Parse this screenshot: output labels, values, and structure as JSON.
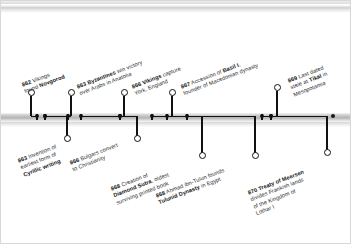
{
  "chart_data": {
    "type": "timeline",
    "title": "",
    "xlabel": "",
    "ylabel": "",
    "axis_range": [
      861.5,
      871.0
    ],
    "grid": false,
    "legend": "none",
    "orientation": "horizontal",
    "events": [
      {
        "year": "862",
        "side": "above",
        "lines": [
          "862 Vikings",
          "found Novgorod"
        ],
        "bold_terms": [
          "862",
          "Novgorod"
        ],
        "full_text": "862 Vikings found Novgorod",
        "tick_x": 37,
        "knob_x": 31,
        "knob_y": 92,
        "label_x": 21,
        "label_y": 82
      },
      {
        "year": "863",
        "side": "below",
        "lines": [
          "863 Invention of",
          "earliest form of",
          "Cyrillic writing"
        ],
        "bold_terms": [
          "863",
          "Cyrillic writing"
        ],
        "full_text": "863 Invention of earliest form of Cyrillic writing",
        "tick_x": 45,
        "knob_x": 67,
        "knob_y": 138,
        "label_x": 17,
        "label_y": 158
      },
      {
        "year": "863",
        "side": "above",
        "lines": [
          "863 Byzantines win victory",
          "over Arabs in Anatolia"
        ],
        "bold_terms": [
          "863",
          "Byzantines"
        ],
        "full_text": "863 Byzantines win victory over Arabs in Anatolia",
        "tick_x": 68,
        "knob_x": 71,
        "knob_y": 92,
        "label_x": 76,
        "label_y": 84
      },
      {
        "year": "866",
        "side": "below",
        "lines": [
          "866 Bulgars convert",
          "to Christianity"
        ],
        "bold_terms": [
          "866"
        ],
        "full_text": "866 Bulgars convert to Christianity",
        "tick_x": 81,
        "knob_x": 137,
        "knob_y": 138,
        "label_x": 69,
        "label_y": 160
      },
      {
        "year": "866",
        "side": "above",
        "lines": [
          "866 Vikings capture",
          "York, England"
        ],
        "bold_terms": [
          "866",
          "Vikings"
        ],
        "full_text": "866 Vikings capture York, England",
        "tick_x": 120,
        "knob_x": 124,
        "knob_y": 92,
        "label_x": 131,
        "label_y": 84
      },
      {
        "year": "868",
        "side": "below",
        "lines": [
          "868 Creation of",
          "Diamond Sutra, oldest",
          "surviving printed book"
        ],
        "bold_terms": [
          "868",
          "Diamond Sutra"
        ],
        "full_text": "868 Creation of Diamond Sutra, oldest surviving printed book",
        "tick_x": 152,
        "knob_x": 202,
        "knob_y": 155,
        "label_x": 110,
        "label_y": 186
      },
      {
        "year": "867",
        "side": "above",
        "lines": [
          "867 Accession of Basil I,",
          "founder of Macedonian dynasty"
        ],
        "bold_terms": [
          "867",
          "Basil I"
        ],
        "full_text": "867 Accession of Basil I, founder of Macedonian dynasty",
        "tick_x": 167,
        "knob_x": 172,
        "knob_y": 92,
        "label_x": 180,
        "label_y": 84
      },
      {
        "year": "868",
        "side": "below",
        "lines": [
          "868 Ahmad ibn-Tulun founds",
          "Tulunid Dynasty in Egypt"
        ],
        "bold_terms": [
          "868",
          "Tulunid Dynasty"
        ],
        "full_text": "868 Ahmad ibn-Tulun founds Tulunid Dynasty in Egypt",
        "tick_x": 187,
        "knob_x": 255,
        "knob_y": 155,
        "label_x": 155,
        "label_y": 193
      },
      {
        "year": "869",
        "side": "above",
        "lines": [
          "869 Last dated",
          "stele at Tikal in",
          "Mesopotamia"
        ],
        "bold_terms": [
          "869",
          "Tikal"
        ],
        "full_text": "869 Last dated stele at Tikal in Mesopotamia",
        "tick_x": 262,
        "knob_x": 277,
        "knob_y": 87,
        "label_x": 287,
        "label_y": 78
      },
      {
        "year": "870",
        "side": "below",
        "lines": [
          "870 Treaty of Meersen",
          "divides Frankish lands",
          "of the Kingdom of",
          "Lothar I"
        ],
        "bold_terms": [
          "870",
          "Treaty of Meersen"
        ],
        "full_text": "870 Treaty of Meersen divides Frankish lands of the Kingdom of Lothar I",
        "tick_x": 271,
        "knob_x": 327,
        "knob_y": 152,
        "label_x": 247,
        "label_y": 190
      }
    ],
    "extra_ticks": [
      45,
      120,
      271,
      333
    ],
    "colors": {
      "background": "#ffffff",
      "axis": "#b4b4b4",
      "marker": "#1a1a1a",
      "text": "#2b2b2b",
      "bold_text": "#111111"
    }
  }
}
